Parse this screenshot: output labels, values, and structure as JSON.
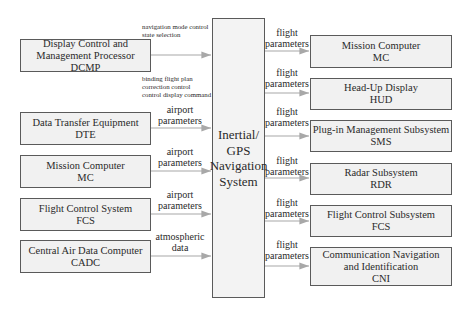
{
  "center": {
    "lines": [
      "Inertial/",
      "GPS",
      "Navigation",
      "System"
    ]
  },
  "inputs": [
    {
      "name": "Display Control and Management Processor",
      "lines": [
        "Display Control and",
        "Management Processor",
        "DCMP"
      ],
      "label_above": [
        "navigation mode control",
        "state selection"
      ],
      "label_below": [
        "binding flight plan",
        "correction control",
        "control display command"
      ]
    },
    {
      "name": "Data Transfer Equipment",
      "lines": [
        "Data Transfer Equipment",
        "DTE"
      ],
      "label": [
        "airport",
        "parameters"
      ]
    },
    {
      "name": "Mission Computer",
      "lines": [
        "Mission Computer",
        "MC"
      ],
      "label": [
        "airport",
        "parameters"
      ]
    },
    {
      "name": "Flight Control System",
      "lines": [
        "Flight Control System",
        "FCS"
      ],
      "label": [
        "airport",
        "parameters"
      ]
    },
    {
      "name": "Central Air Data Computer",
      "lines": [
        "Central Air Data Computer",
        "CADC"
      ],
      "label": [
        "atmospheric",
        "data"
      ]
    }
  ],
  "outputs": [
    {
      "name": "Mission Computer",
      "lines": [
        "Mission Computer",
        "MC"
      ],
      "label": [
        "flight",
        "parameters"
      ]
    },
    {
      "name": "Head-Up Display",
      "lines": [
        "Head-Up Display",
        "HUD"
      ],
      "label": [
        "flight",
        "parameters"
      ]
    },
    {
      "name": "Plug-in Management Subsystem",
      "lines": [
        "Plug-in Management Subsystem",
        "SMS"
      ],
      "label": [
        "flight",
        "parameters"
      ]
    },
    {
      "name": "Radar Subsystem",
      "lines": [
        "Radar Subsystem",
        "RDR"
      ],
      "label": [
        "flight",
        "parameters"
      ]
    },
    {
      "name": "Flight Control Subsystem",
      "lines": [
        "Flight Control Subsystem",
        "FCS"
      ],
      "label": [
        "flight",
        "parameters"
      ]
    },
    {
      "name": "Communication Navigation and Identification",
      "lines": [
        "Communication Navigation",
        "and Identification",
        "CNI"
      ],
      "label": [
        "flight",
        "parameters"
      ]
    }
  ],
  "colors": {
    "box_fill": "#f1f1f1",
    "border": "#5a5a5a",
    "arrow": "#a8a8a8"
  }
}
